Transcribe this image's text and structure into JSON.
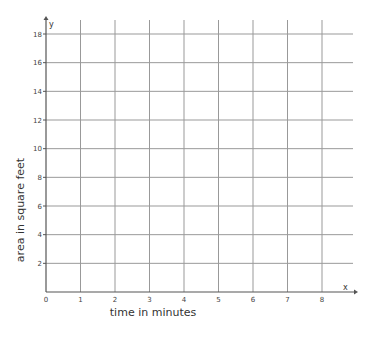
{
  "chart_data": {
    "type": "line",
    "title": "",
    "xlabel": "time in minutes",
    "ylabel": "area in square feet",
    "x_axis_name": "x",
    "y_axis_name": "y",
    "xlim": [
      0,
      8
    ],
    "ylim": [
      0,
      18
    ],
    "x_ticks": [
      "0",
      "1",
      "2",
      "3",
      "4",
      "5",
      "6",
      "7",
      "8"
    ],
    "y_ticks": [
      "2",
      "4",
      "6",
      "8",
      "10",
      "12",
      "14",
      "16",
      "18"
    ],
    "grid": true,
    "series": []
  },
  "colors": {
    "grid": "#999999",
    "axis": "#555555",
    "text": "#333333"
  }
}
